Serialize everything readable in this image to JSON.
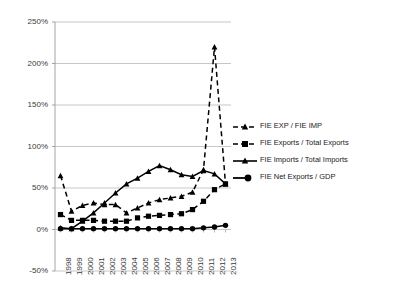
{
  "chart_data": {
    "type": "line",
    "title": "",
    "subtitle": "",
    "xlabel": "",
    "ylabel": "",
    "grid": true,
    "legend_position": "right-middle",
    "ylim": [
      -50,
      250
    ],
    "yticks": [
      -50,
      0,
      50,
      100,
      150,
      200,
      250
    ],
    "ytick_labels": [
      "-50%",
      "0%",
      "50%",
      "100%",
      "150%",
      "200%",
      "250%"
    ],
    "categories": [
      "1998",
      "1999",
      "2000",
      "2001",
      "2002",
      "2003",
      "2004",
      "2005",
      "2006",
      "2007",
      "2008",
      "2009",
      "2010",
      "2011",
      "2012",
      "2013"
    ],
    "series": [
      {
        "name": "FIE EXP / FIE IMP",
        "style": "dashed",
        "marker": "triangle",
        "color": "#000000",
        "values": [
          65,
          22,
          29,
          32,
          30,
          30,
          20,
          26,
          32,
          36,
          38,
          40,
          45,
          72,
          220,
          55
        ]
      },
      {
        "name": "FIE Exports / Total Exports",
        "style": "dashed",
        "marker": "square",
        "color": "#000000",
        "values": [
          18,
          11,
          11,
          11,
          10,
          10,
          10,
          14,
          16,
          17,
          18,
          19,
          24,
          34,
          48,
          55
        ]
      },
      {
        "name": "FIE Imports / Total Imports",
        "style": "solid",
        "marker": "triangle",
        "color": "#000000",
        "values": [
          2,
          1,
          10,
          20,
          32,
          44,
          55,
          62,
          70,
          77,
          72,
          66,
          64,
          71,
          67,
          55
        ]
      },
      {
        "name": "FIE Net Exports / GDP",
        "style": "solid",
        "marker": "circle",
        "color": "#000000",
        "values": [
          1,
          1,
          1,
          1,
          1,
          1,
          1,
          1,
          1,
          1,
          1,
          1,
          1,
          2,
          3,
          5
        ]
      }
    ]
  },
  "legend": {
    "items": [
      {
        "label": "FIE EXP / FIE IMP"
      },
      {
        "label": "FIE Exports / Total Exports"
      },
      {
        "label": "FIE Imports / Total Imports"
      },
      {
        "label": "FIE Net Exports / GDP"
      }
    ]
  }
}
